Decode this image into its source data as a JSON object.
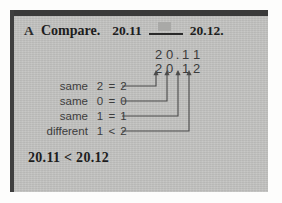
{
  "exercise": {
    "letter": "A",
    "prompt": "Compare.",
    "left_number": "20.11",
    "right_number": "20.12.",
    "blank_placeholder": ""
  },
  "stack": {
    "top_digits": [
      "2",
      "0",
      ".",
      "1",
      "1"
    ],
    "bottom_digits": [
      "2",
      "0",
      ".",
      "1",
      "2"
    ],
    "top_value": "20.11",
    "bottom_value": "20.12"
  },
  "comparisons": [
    {
      "label": "same",
      "expr": "2 = 2"
    },
    {
      "label": "same",
      "expr": "0 = 0"
    },
    {
      "label": "same",
      "expr": "1 = 1"
    },
    {
      "label": "different",
      "expr": "1 < 2"
    }
  ],
  "answer": "20.11 < 20.12",
  "colors": {
    "panel": "#c3c3c1",
    "bar": "#3a3a3a",
    "text": "#1d1d1d",
    "muted": "#3c3c3c",
    "blank_box": "#a9a9a7"
  }
}
